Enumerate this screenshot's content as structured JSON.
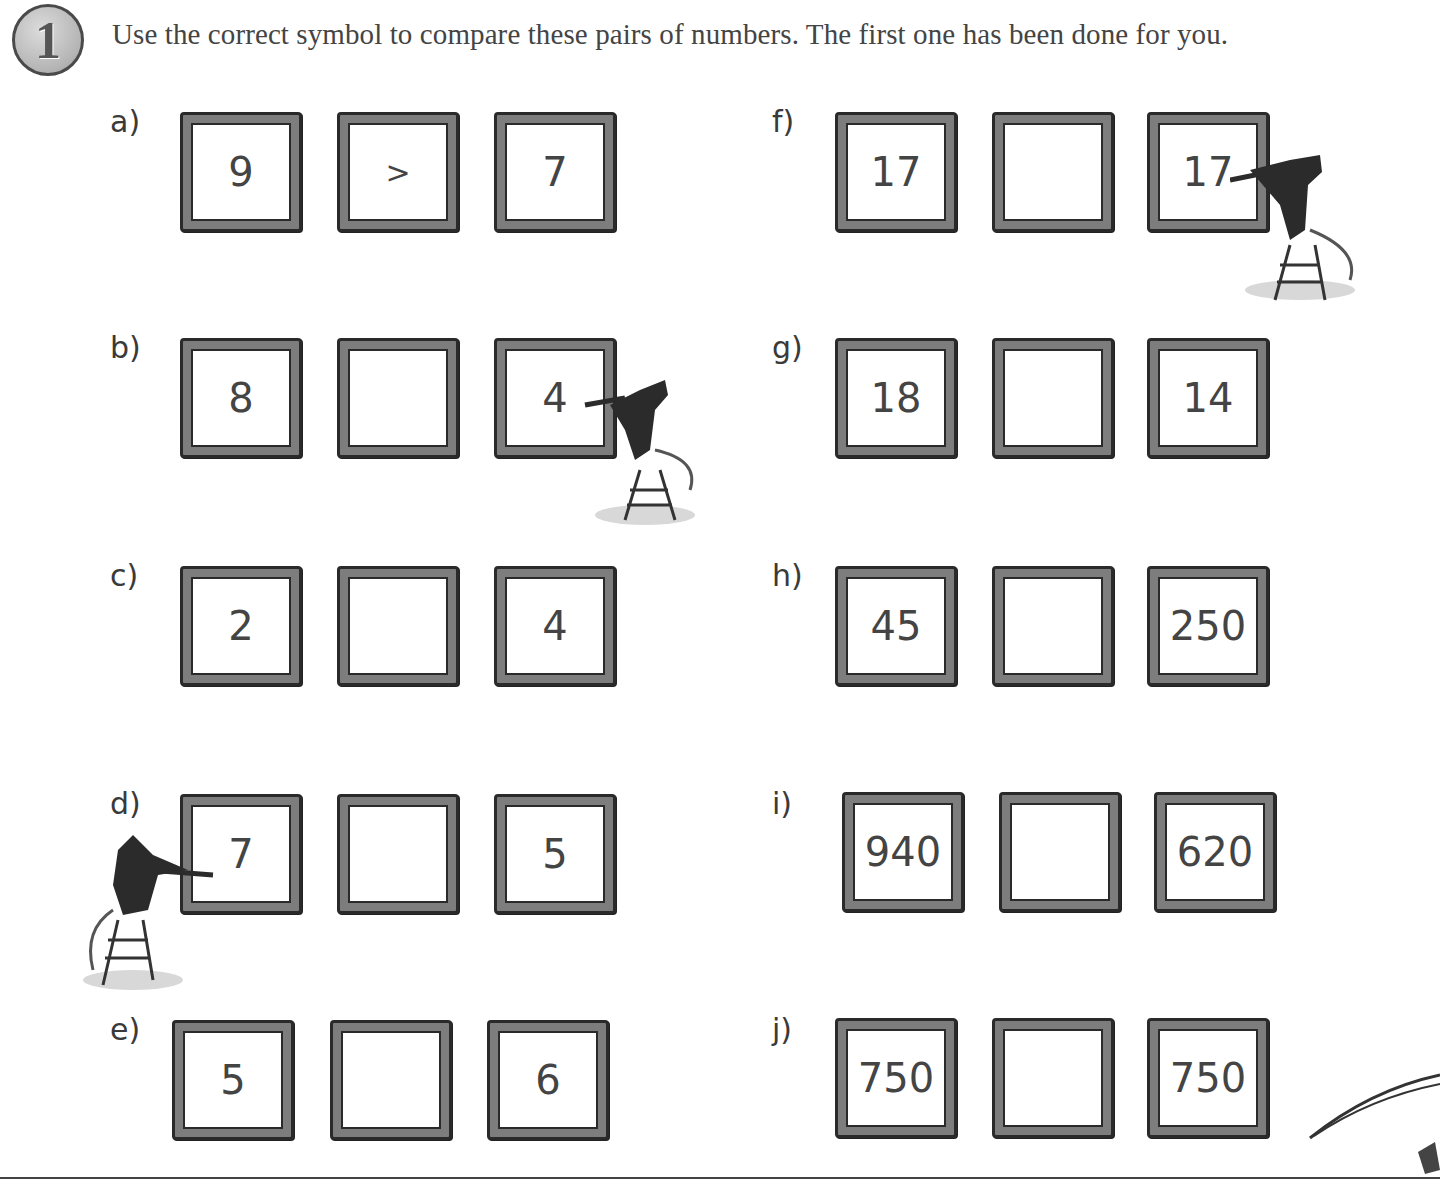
{
  "header": {
    "question_number": "1",
    "instruction": "Use the correct symbol to compare these pairs of numbers. The first one has been done for you."
  },
  "questions": [
    {
      "label": "a)",
      "left": "9",
      "symbol": ">",
      "right": "7"
    },
    {
      "label": "b)",
      "left": "8",
      "symbol": "",
      "right": "4"
    },
    {
      "label": "c)",
      "left": "2",
      "symbol": "",
      "right": "4"
    },
    {
      "label": "d)",
      "left": "7",
      "symbol": "",
      "right": "5"
    },
    {
      "label": "e)",
      "left": "5",
      "symbol": "",
      "right": "6"
    },
    {
      "label": "f)",
      "left": "17",
      "symbol": "",
      "right": "17"
    },
    {
      "label": "g)",
      "left": "18",
      "symbol": "",
      "right": "14"
    },
    {
      "label": "h)",
      "left": "45",
      "symbol": "",
      "right": "250"
    },
    {
      "label": "i)",
      "left": "940",
      "symbol": "",
      "right": "620"
    },
    {
      "label": "j)",
      "left": "750",
      "symbol": "",
      "right": "750"
    }
  ],
  "colors": {
    "frame": "#7d7d7d",
    "frame_outline": "#2a2a2a",
    "text": "#444444"
  }
}
